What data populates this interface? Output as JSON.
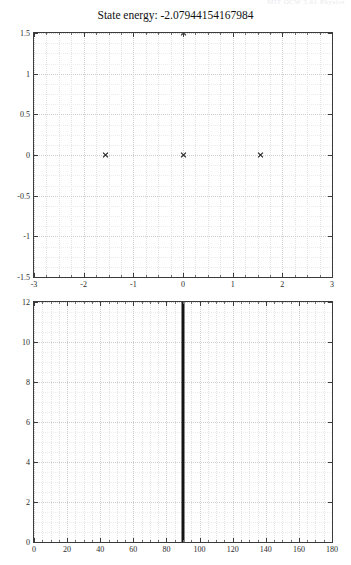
{
  "header": {
    "clipped_text": "MIT  OCW  5.61  Physics"
  },
  "figure": {
    "title": "State energy: -2.07944154167984"
  },
  "chart_data": [
    {
      "type": "scatter",
      "title": "State energy: -2.07944154167984",
      "xlabel": "",
      "ylabel": "",
      "xlim": [
        -3,
        3
      ],
      "ylim": [
        -1.5,
        1.5
      ],
      "grid": true,
      "legend": null,
      "xticks": [
        -3,
        -2,
        -1,
        0,
        1,
        2,
        3
      ],
      "xticklabels": [
        "-3",
        "-2",
        "-1",
        "0",
        "1",
        "2",
        "3"
      ],
      "yticks": [
        -1.5,
        -1,
        -0.5,
        0,
        0.5,
        1,
        1.5
      ],
      "yticklabels": [
        "-1.5",
        "-1",
        "-0.5",
        "0",
        "0.5",
        "1",
        "1.5"
      ],
      "marker": "x",
      "points": [
        {
          "x": -1.57,
          "y": 0
        },
        {
          "x": 0,
          "y": 0
        },
        {
          "x": 1.57,
          "y": 0
        },
        {
          "x": 0,
          "y": 1.5
        }
      ]
    },
    {
      "type": "line",
      "title": "",
      "xlabel": "",
      "ylabel": "",
      "xlim": [
        0,
        180
      ],
      "ylim": [
        0,
        12
      ],
      "grid": true,
      "legend": null,
      "xticks": [
        0,
        20,
        40,
        60,
        80,
        100,
        120,
        140,
        160,
        180
      ],
      "xticklabels": [
        "0",
        "20",
        "40",
        "60",
        "80",
        "100",
        "120",
        "140",
        "160",
        "180"
      ],
      "yticks": [
        0,
        2,
        4,
        6,
        8,
        10,
        12
      ],
      "yticklabels": [
        "0",
        "2",
        "4",
        "6",
        "8",
        "10",
        "12"
      ],
      "series": [
        {
          "name": "vertical-marker",
          "x": [
            90,
            90
          ],
          "y": [
            0,
            12
          ]
        }
      ]
    }
  ]
}
